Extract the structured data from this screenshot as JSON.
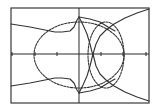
{
  "chart_data": {
    "type": "line",
    "title": "",
    "xlabel": "",
    "ylabel": "",
    "grid": false,
    "legend": null,
    "axes": {
      "frame_px": {
        "x0": 11,
        "y0": 8,
        "x1": 149,
        "y1": 103
      },
      "origin_px": {
        "x": 79,
        "y": 54
      },
      "x_ticks_px": [
        12,
        35,
        57,
        101,
        123,
        146
      ],
      "y_ticks_px": []
    },
    "series": [
      {
        "name": "large-ellipse",
        "kind": "ellipse",
        "style": "dashed",
        "center_px": [
          79,
          55
        ],
        "rx": 45,
        "ry": 33
      },
      {
        "name": "right-circle",
        "kind": "ellipse",
        "style": "dashed",
        "center_px": [
          106,
          55
        ],
        "rx": 18,
        "ry": 33
      },
      {
        "name": "upper-left-curve",
        "kind": "polyline",
        "points_px": [
          [
            11,
            24
          ],
          [
            30,
            27
          ],
          [
            45,
            30
          ],
          [
            55,
            32
          ],
          [
            62,
            32
          ],
          [
            70,
            31
          ],
          [
            74,
            27
          ],
          [
            77,
            20
          ],
          [
            79,
            17
          ]
        ]
      },
      {
        "name": "lower-left-curve",
        "kind": "polyline",
        "points_px": [
          [
            11,
            86
          ],
          [
            30,
            83
          ],
          [
            45,
            80
          ],
          [
            55,
            78
          ],
          [
            62,
            78
          ],
          [
            70,
            79
          ],
          [
            74,
            83
          ],
          [
            77,
            90
          ],
          [
            79,
            93
          ]
        ]
      },
      {
        "name": "upper-cusp-curve",
        "kind": "polyline",
        "points_px": [
          [
            79,
            17
          ],
          [
            83,
            25
          ],
          [
            87,
            34
          ],
          [
            90,
            44
          ],
          [
            92,
            52
          ],
          [
            93,
            54
          ]
        ]
      },
      {
        "name": "lower-cusp-curve",
        "kind": "polyline",
        "points_px": [
          [
            79,
            93
          ],
          [
            83,
            85
          ],
          [
            87,
            76
          ],
          [
            90,
            66
          ],
          [
            92,
            58
          ],
          [
            93,
            54
          ]
        ]
      },
      {
        "name": "upper-right-branch",
        "kind": "polyline",
        "points_px": [
          [
            93,
            54
          ],
          [
            96,
            44
          ],
          [
            100,
            36
          ],
          [
            106,
            30
          ],
          [
            114,
            24
          ],
          [
            125,
            18
          ],
          [
            137,
            13
          ],
          [
            149,
            9
          ]
        ]
      },
      {
        "name": "lower-right-branch",
        "kind": "polyline",
        "points_px": [
          [
            93,
            54
          ],
          [
            96,
            66
          ],
          [
            100,
            74
          ],
          [
            106,
            80
          ],
          [
            114,
            86
          ],
          [
            125,
            92
          ],
          [
            137,
            97
          ],
          [
            149,
            101
          ]
        ]
      },
      {
        "name": "upper-ellipse-link",
        "kind": "polyline",
        "points_px": [
          [
            79,
            17
          ],
          [
            90,
            19
          ],
          [
            100,
            22
          ],
          [
            108,
            27
          ],
          [
            115,
            31
          ]
        ]
      },
      {
        "name": "lower-ellipse-link",
        "kind": "polyline",
        "points_px": [
          [
            79,
            93
          ],
          [
            90,
            91
          ],
          [
            100,
            88
          ],
          [
            108,
            83
          ],
          [
            115,
            79
          ]
        ]
      }
    ]
  },
  "screen": {
    "background": "#ffffff",
    "ink": "#333333"
  }
}
